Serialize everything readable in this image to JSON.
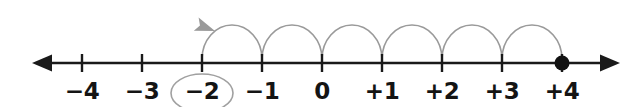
{
  "figure": {
    "background_color": "#ffffff",
    "axis_color": "#1a1a1a",
    "arc_color": "#9a9a9a",
    "circle_highlight_color": "#a0a0a0",
    "label_color": "#141414",
    "dot_color": "#111111"
  },
  "chart_data": {
    "type": "numberline",
    "title": "",
    "xlabel": "",
    "ylabel": "",
    "axis": {
      "min": -4,
      "max": 4,
      "step": 1,
      "left_arrow": true,
      "right_arrow": true
    },
    "ticks": [
      {
        "value": -4,
        "label": "−4",
        "x": 82,
        "circled": false,
        "point": false
      },
      {
        "value": -3,
        "label": "−3",
        "x": 142,
        "circled": false,
        "point": false
      },
      {
        "value": -2,
        "label": "−2",
        "x": 202,
        "circled": true,
        "point": false
      },
      {
        "value": -1,
        "label": "−1",
        "x": 262,
        "circled": false,
        "point": false
      },
      {
        "value": 0,
        "label": "0",
        "x": 322,
        "circled": false,
        "point": false
      },
      {
        "value": 1,
        "label": "+1",
        "x": 382,
        "circled": false,
        "point": false
      },
      {
        "value": 2,
        "label": "+2",
        "x": 442,
        "circled": false,
        "point": false
      },
      {
        "value": 3,
        "label": "+3",
        "x": 502,
        "circled": false,
        "point": false
      },
      {
        "value": 4,
        "label": "+4",
        "x": 562,
        "circled": true,
        "point": true
      }
    ],
    "point_marker": {
      "value": 4,
      "style": "filled-dot"
    },
    "highlight": {
      "value": -2,
      "style": "ellipse-around-label"
    },
    "arcs": {
      "count": 6,
      "direction": "leftward",
      "from": 4,
      "to": -2,
      "arrowhead_at": -2,
      "spans": [
        {
          "from": 4,
          "to": 3
        },
        {
          "from": 3,
          "to": 2
        },
        {
          "from": 2,
          "to": 1
        },
        {
          "from": 1,
          "to": 0
        },
        {
          "from": 0,
          "to": -1
        },
        {
          "from": -1,
          "to": -2
        }
      ]
    }
  }
}
